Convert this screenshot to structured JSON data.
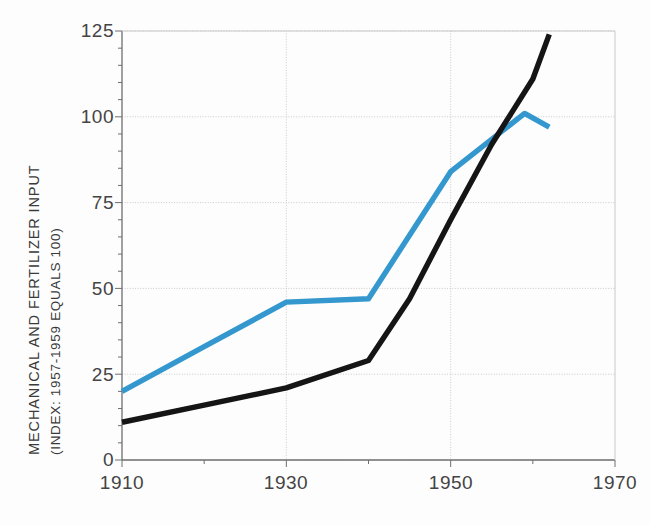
{
  "chart_data": {
    "type": "line",
    "title": "",
    "subtitle": "",
    "xlabel": "",
    "ylabel": "MECHANICAL AND FERTILIZER INPUT",
    "ylabel_line2": "(INDEX: 1957-1959 EQUALS 100)",
    "xlim": [
      1910,
      1970
    ],
    "ylim": [
      0,
      125
    ],
    "xticks": [
      "1910",
      "1930",
      "1950",
      "1970"
    ],
    "xtick_values": [
      1910,
      1930,
      1950,
      1970
    ],
    "yticks": [
      "0",
      "25",
      "50",
      "75",
      "100",
      "125"
    ],
    "ytick_values": [
      0,
      25,
      50,
      75,
      100,
      125
    ],
    "grid": true,
    "legend": "none",
    "series": [
      {
        "name": "fertilizer-input",
        "color": "#3498cf",
        "x": [
          1910,
          1920,
          1930,
          1940,
          1950,
          1959,
          1962
        ],
        "values": [
          20,
          33,
          46,
          47,
          84,
          101,
          97
        ]
      },
      {
        "name": "mechanical-input",
        "color": "#151515",
        "x": [
          1910,
          1920,
          1930,
          1940,
          1945,
          1950,
          1955,
          1960,
          1962
        ],
        "values": [
          11,
          16,
          21,
          29,
          47,
          70,
          92,
          111,
          124
        ]
      }
    ]
  },
  "colors": {
    "series_blue": "#3498cf",
    "series_black": "#151515",
    "grid": "#c9c9c9",
    "axis": "#6f6f6f",
    "text": "#3a3a3a",
    "background": "#fdfdfd"
  },
  "axes": {
    "y_title_line1": "MECHANICAL AND FERTILIZER INPUT",
    "y_title_line2": "(INDEX: 1957-1959 EQUALS 100)",
    "y_labels": [
      "125",
      "100",
      "75",
      "50",
      "25",
      "0"
    ],
    "x_labels": [
      "1910",
      "1930",
      "1950",
      "1970"
    ]
  }
}
